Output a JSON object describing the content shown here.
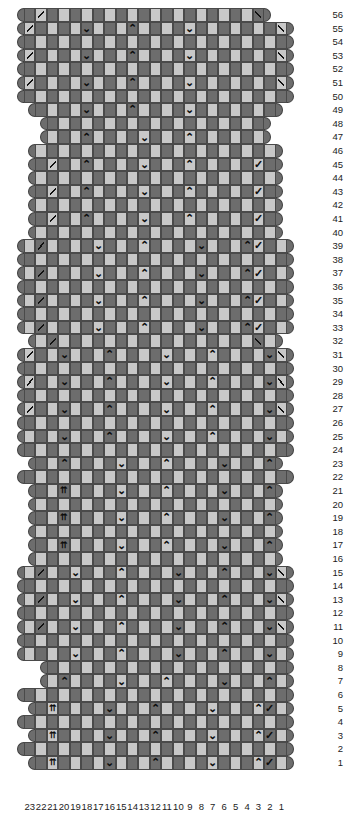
{
  "chart": {
    "columns": 23,
    "rows": 56,
    "column_numbers": [
      23,
      22,
      21,
      20,
      19,
      18,
      17,
      16,
      15,
      14,
      13,
      12,
      11,
      10,
      9,
      8,
      7,
      6,
      5,
      4,
      3,
      2,
      1
    ],
    "row_numbers": [
      56,
      55,
      54,
      53,
      52,
      51,
      50,
      49,
      48,
      47,
      46,
      45,
      44,
      43,
      42,
      41,
      40,
      39,
      38,
      37,
      36,
      35,
      34,
      33,
      32,
      31,
      30,
      29,
      28,
      27,
      26,
      25,
      24,
      23,
      22,
      21,
      20,
      19,
      18,
      17,
      16,
      15,
      14,
      13,
      12,
      11,
      10,
      9,
      8,
      7,
      6,
      5,
      4,
      3,
      2,
      1
    ],
    "colors": {
      "dark_cell": "#6d6d6d",
      "light_cell": "#c8c8c8",
      "cell_border": "#4a4a4a",
      "cap": "#6d6d6d",
      "symbol": "#0d0d0d",
      "background": "#ffffff",
      "text": "#1c1c1c"
    },
    "symbol_legend": [
      {
        "key": "down",
        "glyph": "⌄",
        "name": "down-arrow-symbol"
      },
      {
        "key": "up",
        "glyph": "⌃",
        "name": "up-arrow-symbol"
      },
      {
        "key": "dbl",
        "glyph": "⇈",
        "name": "double-up-arrow-symbol"
      },
      {
        "key": "dl",
        "glyph": "╲",
        "name": "left-slant-decrease-symbol"
      },
      {
        "key": "dr",
        "glyph": "╱",
        "name": "right-slant-decrease-symbol"
      },
      {
        "key": "vr",
        "glyph": "✓",
        "name": "check-slant-symbol"
      }
    ],
    "rows_data": [
      {
        "n": 56,
        "start": 0,
        "len": 21,
        "parity": 0,
        "sym": {
          "1": "dl",
          "20": "dr"
        }
      },
      {
        "n": 55,
        "start": 0,
        "len": 23,
        "parity": 1,
        "sym": {
          "0": "dl",
          "5": "down",
          "9": "up",
          "14": "down",
          "22": "dr"
        }
      },
      {
        "n": 54,
        "start": 0,
        "len": 23,
        "parity": 0,
        "sym": {}
      },
      {
        "n": 53,
        "start": 0,
        "len": 23,
        "parity": 1,
        "sym": {
          "0": "dl",
          "5": "down",
          "9": "up",
          "14": "down",
          "22": "dr"
        }
      },
      {
        "n": 52,
        "start": 0,
        "len": 23,
        "parity": 0,
        "sym": {}
      },
      {
        "n": 51,
        "start": 0,
        "len": 23,
        "parity": 1,
        "sym": {
          "0": "dl",
          "5": "down",
          "9": "up",
          "14": "down",
          "22": "dr"
        }
      },
      {
        "n": 50,
        "start": 0,
        "len": 23,
        "parity": 0,
        "sym": {}
      },
      {
        "n": 49,
        "start": 1,
        "len": 21,
        "parity": 1,
        "sym": {
          "4": "down",
          "8": "up",
          "13": "down"
        }
      },
      {
        "n": 48,
        "start": 2,
        "len": 19,
        "parity": 0,
        "sym": {}
      },
      {
        "n": 47,
        "start": 2,
        "len": 19,
        "parity": 1,
        "sym": {
          "3": "up",
          "8": "down",
          "12": "up"
        }
      },
      {
        "n": 46,
        "start": 1,
        "len": 21,
        "parity": 0,
        "sym": {}
      },
      {
        "n": 45,
        "start": 1,
        "len": 21,
        "parity": 1,
        "sym": {
          "1": "dl",
          "4": "up",
          "9": "down",
          "13": "up",
          "19": "vr"
        }
      },
      {
        "n": 44,
        "start": 1,
        "len": 21,
        "parity": 0,
        "sym": {}
      },
      {
        "n": 43,
        "start": 1,
        "len": 21,
        "parity": 1,
        "sym": {
          "1": "dl",
          "4": "up",
          "9": "down",
          "13": "up",
          "19": "vr"
        }
      },
      {
        "n": 42,
        "start": 1,
        "len": 21,
        "parity": 0,
        "sym": {}
      },
      {
        "n": 41,
        "start": 1,
        "len": 21,
        "parity": 1,
        "sym": {
          "1": "dl",
          "4": "up",
          "9": "down",
          "13": "up",
          "19": "vr"
        }
      },
      {
        "n": 40,
        "start": 1,
        "len": 21,
        "parity": 0,
        "sym": {}
      },
      {
        "n": 39,
        "start": 0,
        "len": 23,
        "parity": 1,
        "sym": {
          "1": "dl",
          "6": "down",
          "10": "up",
          "15": "down",
          "19": "up",
          "20": "vr"
        }
      },
      {
        "n": 38,
        "start": 0,
        "len": 23,
        "parity": 0,
        "sym": {}
      },
      {
        "n": 37,
        "start": 0,
        "len": 23,
        "parity": 1,
        "sym": {
          "1": "dl",
          "6": "down",
          "10": "up",
          "15": "down",
          "19": "up",
          "20": "vr"
        }
      },
      {
        "n": 36,
        "start": 0,
        "len": 23,
        "parity": 0,
        "sym": {}
      },
      {
        "n": 35,
        "start": 0,
        "len": 23,
        "parity": 1,
        "sym": {
          "1": "dl",
          "6": "down",
          "10": "up",
          "15": "down",
          "19": "up",
          "20": "vr"
        }
      },
      {
        "n": 34,
        "start": 0,
        "len": 23,
        "parity": 0,
        "sym": {}
      },
      {
        "n": 33,
        "start": 0,
        "len": 23,
        "parity": 1,
        "sym": {
          "1": "dl",
          "6": "down",
          "10": "up",
          "15": "down",
          "19": "up",
          "20": "vr"
        }
      },
      {
        "n": 32,
        "start": 1,
        "len": 21,
        "parity": 0,
        "sym": {
          "1": "dl",
          "19": "dr"
        }
      },
      {
        "n": 31,
        "start": 0,
        "len": 23,
        "parity": 1,
        "sym": {
          "0": "dl",
          "3": "down",
          "7": "up",
          "12": "down",
          "16": "up",
          "21": "down",
          "22": "dr"
        }
      },
      {
        "n": 30,
        "start": 0,
        "len": 23,
        "parity": 0,
        "sym": {}
      },
      {
        "n": 29,
        "start": 0,
        "len": 23,
        "parity": 1,
        "sym": {
          "0": "dl",
          "3": "down",
          "7": "up",
          "12": "down",
          "16": "up",
          "21": "down",
          "22": "dr"
        }
      },
      {
        "n": 28,
        "start": 0,
        "len": 23,
        "parity": 0,
        "sym": {}
      },
      {
        "n": 27,
        "start": 0,
        "len": 23,
        "parity": 1,
        "sym": {
          "0": "dl",
          "3": "down",
          "7": "up",
          "12": "down",
          "16": "up",
          "21": "down",
          "22": "dr"
        }
      },
      {
        "n": 26,
        "start": 0,
        "len": 23,
        "parity": 0,
        "sym": {}
      },
      {
        "n": 25,
        "start": 0,
        "len": 23,
        "parity": 1,
        "sym": {
          "3": "down",
          "7": "up",
          "12": "down",
          "16": "up",
          "21": "down"
        }
      },
      {
        "n": 24,
        "start": 0,
        "len": 23,
        "parity": 0,
        "sym": {}
      },
      {
        "n": 23,
        "start": 1,
        "len": 21,
        "parity": 1,
        "sym": {
          "2": "up",
          "7": "down",
          "11": "up",
          "16": "down",
          "20": "up"
        }
      },
      {
        "n": 22,
        "start": 0,
        "len": 23,
        "parity": 0,
        "sym": {}
      },
      {
        "n": 21,
        "start": 1,
        "len": 21,
        "parity": 1,
        "sym": {
          "2": "dbl",
          "7": "down",
          "11": "up",
          "16": "down",
          "20": "up",
          "21": "vr"
        }
      },
      {
        "n": 20,
        "start": 1,
        "len": 21,
        "parity": 0,
        "sym": {}
      },
      {
        "n": 19,
        "start": 1,
        "len": 21,
        "parity": 1,
        "sym": {
          "2": "dbl",
          "7": "down",
          "11": "up",
          "16": "down",
          "20": "up",
          "21": "vr"
        }
      },
      {
        "n": 18,
        "start": 1,
        "len": 21,
        "parity": 0,
        "sym": {}
      },
      {
        "n": 17,
        "start": 1,
        "len": 21,
        "parity": 1,
        "sym": {
          "2": "dbl",
          "7": "down",
          "11": "up",
          "16": "down",
          "20": "up",
          "21": "vr"
        }
      },
      {
        "n": 16,
        "start": 1,
        "len": 21,
        "parity": 0,
        "sym": {}
      },
      {
        "n": 15,
        "start": 0,
        "len": 23,
        "parity": 1,
        "sym": {
          "1": "dl",
          "4": "down",
          "8": "up",
          "13": "down",
          "17": "up",
          "21": "down",
          "22": "dr"
        }
      },
      {
        "n": 14,
        "start": 0,
        "len": 23,
        "parity": 0,
        "sym": {}
      },
      {
        "n": 13,
        "start": 0,
        "len": 23,
        "parity": 1,
        "sym": {
          "1": "dl",
          "4": "down",
          "8": "up",
          "13": "down",
          "17": "up",
          "21": "down",
          "22": "dr"
        }
      },
      {
        "n": 12,
        "start": 0,
        "len": 23,
        "parity": 0,
        "sym": {}
      },
      {
        "n": 11,
        "start": 0,
        "len": 23,
        "parity": 1,
        "sym": {
          "1": "dl",
          "4": "down",
          "8": "up",
          "13": "down",
          "17": "up",
          "21": "down",
          "22": "dr"
        }
      },
      {
        "n": 10,
        "start": 0,
        "len": 23,
        "parity": 0,
        "sym": {}
      },
      {
        "n": 9,
        "start": 0,
        "len": 23,
        "parity": 1,
        "sym": {
          "4": "down",
          "8": "up",
          "13": "down",
          "17": "up",
          "21": "down"
        }
      },
      {
        "n": 8,
        "start": 2,
        "len": 21,
        "parity": 0,
        "sym": {}
      },
      {
        "n": 7,
        "start": 2,
        "len": 21,
        "parity": 1,
        "sym": {
          "1": "up",
          "6": "down",
          "10": "up",
          "15": "down",
          "19": "up"
        }
      },
      {
        "n": 6,
        "start": 0,
        "len": 23,
        "parity": 0,
        "sym": {}
      },
      {
        "n": 5,
        "start": 1,
        "len": 22,
        "parity": 1,
        "sym": {
          "1": "dbl",
          "6": "down",
          "10": "up",
          "15": "down",
          "19": "up",
          "20": "vr"
        }
      },
      {
        "n": 4,
        "start": 0,
        "len": 23,
        "parity": 0,
        "sym": {}
      },
      {
        "n": 3,
        "start": 1,
        "len": 22,
        "parity": 1,
        "sym": {
          "1": "dbl",
          "6": "down",
          "10": "up",
          "15": "down",
          "19": "up",
          "20": "vr"
        }
      },
      {
        "n": 2,
        "start": 0,
        "len": 23,
        "parity": 0,
        "sym": {}
      },
      {
        "n": 1,
        "start": 1,
        "len": 22,
        "parity": 1,
        "sym": {
          "1": "dbl",
          "6": "down",
          "10": "up",
          "15": "down",
          "19": "up",
          "20": "vr"
        }
      }
    ]
  }
}
